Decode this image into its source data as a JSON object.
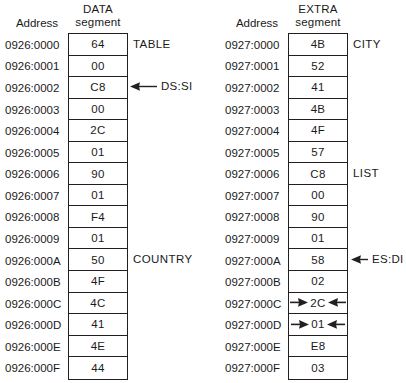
{
  "figure": {
    "address_header": "Address"
  },
  "panels": [
    {
      "id": "data-segment",
      "segment_title_line1": "DATA",
      "segment_title_line2": "segment",
      "address_header": "Address",
      "rows": [
        {
          "address": "0926:0000",
          "value": "64",
          "label": "TABLE",
          "pointer": "",
          "inward": false
        },
        {
          "address": "0926:0001",
          "value": "00",
          "label": "",
          "pointer": "",
          "inward": false
        },
        {
          "address": "0926:0002",
          "value": "C8",
          "label": "",
          "pointer": "DS:SI",
          "inward": false
        },
        {
          "address": "0926:0003",
          "value": "00",
          "label": "",
          "pointer": "",
          "inward": false
        },
        {
          "address": "0926:0004",
          "value": "2C",
          "label": "",
          "pointer": "",
          "inward": false
        },
        {
          "address": "0926:0005",
          "value": "01",
          "label": "",
          "pointer": "",
          "inward": false
        },
        {
          "address": "0926:0006",
          "value": "90",
          "label": "",
          "pointer": "",
          "inward": false
        },
        {
          "address": "0926:0007",
          "value": "01",
          "label": "",
          "pointer": "",
          "inward": false
        },
        {
          "address": "0926:0008",
          "value": "F4",
          "label": "",
          "pointer": "",
          "inward": false
        },
        {
          "address": "0926:0009",
          "value": "01",
          "label": "",
          "pointer": "",
          "inward": false
        },
        {
          "address": "0926:000A",
          "value": "50",
          "label": "COUNTRY",
          "pointer": "",
          "inward": false
        },
        {
          "address": "0926:000B",
          "value": "4F",
          "label": "",
          "pointer": "",
          "inward": false
        },
        {
          "address": "0926:000C",
          "value": "4C",
          "label": "",
          "pointer": "",
          "inward": false
        },
        {
          "address": "0926:000D",
          "value": "41",
          "label": "",
          "pointer": "",
          "inward": false
        },
        {
          "address": "0926:000E",
          "value": "4E",
          "label": "",
          "pointer": "",
          "inward": false
        },
        {
          "address": "0926:000F",
          "value": "44",
          "label": "",
          "pointer": "",
          "inward": false
        }
      ]
    },
    {
      "id": "extra-segment",
      "segment_title_line1": "EXTRA",
      "segment_title_line2": "segment",
      "address_header": "Address",
      "rows": [
        {
          "address": "0927:0000",
          "value": "4B",
          "label": "CITY",
          "pointer": "",
          "inward": false
        },
        {
          "address": "0927:0001",
          "value": "52",
          "label": "",
          "pointer": "",
          "inward": false
        },
        {
          "address": "0927:0002",
          "value": "41",
          "label": "",
          "pointer": "",
          "inward": false
        },
        {
          "address": "0927:0003",
          "value": "4B",
          "label": "",
          "pointer": "",
          "inward": false
        },
        {
          "address": "0927:0004",
          "value": "4F",
          "label": "",
          "pointer": "",
          "inward": false
        },
        {
          "address": "0927:0005",
          "value": "57",
          "label": "",
          "pointer": "",
          "inward": false
        },
        {
          "address": "0927:0006",
          "value": "C8",
          "label": "LIST",
          "pointer": "",
          "inward": false
        },
        {
          "address": "0927:0007",
          "value": "00",
          "label": "",
          "pointer": "",
          "inward": false
        },
        {
          "address": "0927:0008",
          "value": "90",
          "label": "",
          "pointer": "",
          "inward": false
        },
        {
          "address": "0927:0009",
          "value": "01",
          "label": "",
          "pointer": "",
          "inward": false
        },
        {
          "address": "0927:000A",
          "value": "58",
          "label": "",
          "pointer": "ES:DI",
          "inward": false
        },
        {
          "address": "0927:000B",
          "value": "02",
          "label": "",
          "pointer": "",
          "inward": false
        },
        {
          "address": "0927:000C",
          "value": "2C",
          "label": "",
          "pointer": "",
          "inward": true
        },
        {
          "address": "0927:000D",
          "value": "01",
          "label": "",
          "pointer": "",
          "inward": true
        },
        {
          "address": "0927:000E",
          "value": "E8",
          "label": "",
          "pointer": "",
          "inward": false
        },
        {
          "address": "0927:000F",
          "value": "03",
          "label": "",
          "pointer": "",
          "inward": false
        }
      ]
    }
  ],
  "colors": {
    "ink": "#231f20",
    "background": "#ffffff"
  }
}
